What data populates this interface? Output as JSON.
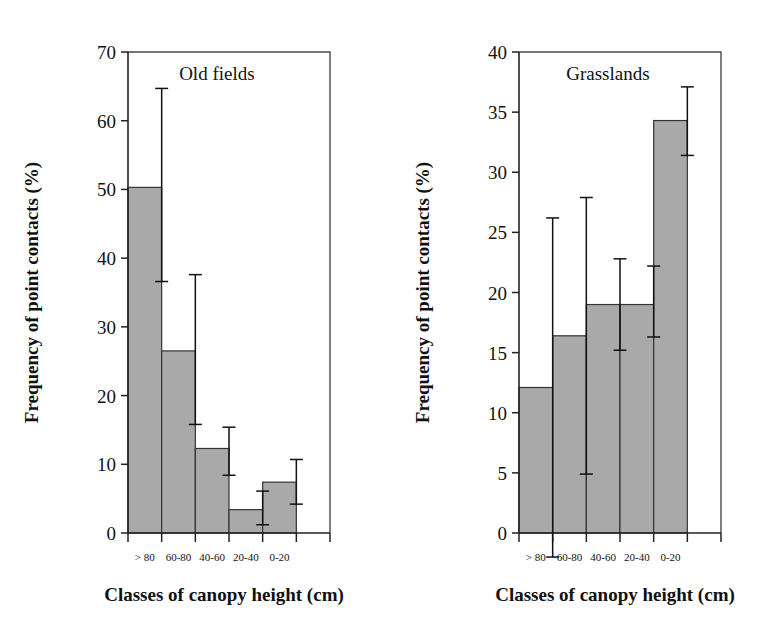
{
  "figure": {
    "background": "#ffffff",
    "bar_fill": "#a9a9a9",
    "bar_stroke": "#333333",
    "axis_color": "#222222",
    "frame_color": "#4a4a4a"
  },
  "chart_data": [
    {
      "type": "bar",
      "id": "old-fields",
      "title": "Old fields",
      "xlabel": "Classes of canopy height (cm)",
      "ylabel": "Frequency of point contacts (%)",
      "categories": [
        "> 80",
        "60-80",
        "40-60",
        "20-40",
        "0-20"
      ],
      "values": [
        50.3,
        26.5,
        12.3,
        3.4,
        7.4
      ],
      "error_upper": [
        64.7,
        37.6,
        15.4,
        6.1,
        10.7
      ],
      "error_lower": [
        36.6,
        15.8,
        8.4,
        1.2,
        4.2
      ],
      "ylim": [
        0,
        70
      ],
      "yticks": [
        0,
        10,
        20,
        30,
        40,
        50,
        60,
        70
      ],
      "ytick_labels": [
        "0",
        "10",
        "20",
        "30",
        "40",
        "50",
        "60",
        "70"
      ],
      "grid": false,
      "legend": "none"
    },
    {
      "type": "bar",
      "id": "grasslands",
      "title": "Grasslands",
      "xlabel": "Classes of canopy height (cm)",
      "ylabel": "Frequency of point contacts (%)",
      "categories": [
        "> 80",
        "60-80",
        "40-60",
        "20-40",
        "0-20"
      ],
      "values": [
        12.1,
        16.4,
        19.0,
        19.0,
        34.3
      ],
      "error_upper": [
        26.2,
        27.9,
        22.8,
        22.2,
        37.1
      ],
      "error_lower": [
        -2.0,
        4.9,
        15.2,
        16.3,
        31.4
      ],
      "ylim": [
        0,
        40
      ],
      "yticks": [
        0,
        5,
        10,
        15,
        20,
        25,
        30,
        35,
        40
      ],
      "ytick_labels": [
        "0",
        "5",
        "10",
        "15",
        "20",
        "25",
        "30",
        "35",
        "40"
      ],
      "grid": false,
      "legend": "none"
    }
  ]
}
